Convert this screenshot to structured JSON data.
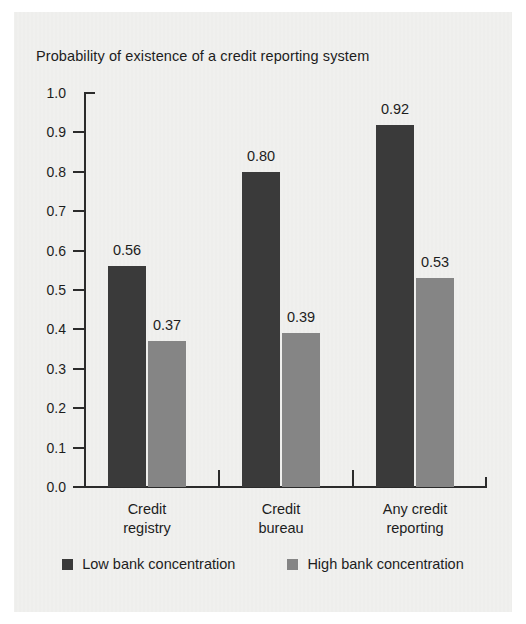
{
  "chart_data": {
    "type": "bar",
    "title": "Probability of existence of a credit reporting system",
    "xlabel": "",
    "ylabel": "",
    "ylim": [
      0.0,
      1.0
    ],
    "ytick_labels": [
      "1.0",
      "0.9",
      "0.8",
      "0.7",
      "0.6",
      "0.5",
      "0.4",
      "0.3",
      "0.2",
      "0.1",
      "0.0"
    ],
    "ytick_values": [
      1.0,
      0.9,
      0.8,
      0.7,
      0.6,
      0.5,
      0.4,
      0.3,
      0.2,
      0.1,
      0.0
    ],
    "grid": false,
    "legend_position": "bottom-center",
    "categories": [
      "Credit registry",
      "Credit bureau",
      "Any credit reporting"
    ],
    "category_lines": [
      [
        "Credit",
        "registry"
      ],
      [
        "Credit",
        "bureau"
      ],
      [
        "Any credit",
        "reporting"
      ]
    ],
    "series": [
      {
        "name": "Low bank concentration",
        "color": "#3a3a3a",
        "values": [
          0.56,
          0.8,
          0.92
        ],
        "value_labels": [
          "0.56",
          "0.80",
          "0.92"
        ]
      },
      {
        "name": "High bank concentration",
        "color": "#858585",
        "values": [
          0.37,
          0.39,
          0.53
        ],
        "value_labels": [
          "0.37",
          "0.39",
          "0.53"
        ]
      }
    ]
  },
  "legend": {
    "items": [
      {
        "label": "Low bank concentration",
        "swatch": "low"
      },
      {
        "label": "High bank concentration",
        "swatch": "high"
      }
    ]
  },
  "colors": {
    "background": "#eeeeec",
    "axis": "#2b2b2b",
    "text": "#1d1d1d",
    "series_low": "#3a3a3a",
    "series_high": "#858585"
  }
}
